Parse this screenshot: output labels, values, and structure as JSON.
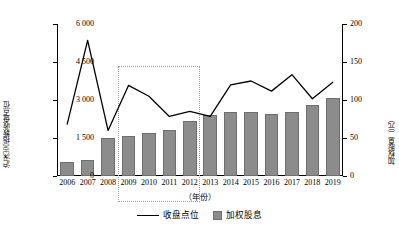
{
  "chart_data": {
    "type": "bar",
    "title": "",
    "xlabel": "（年份）",
    "categories": [
      "2006",
      "2007",
      "2008",
      "2009",
      "2010",
      "2011",
      "2012",
      "2013",
      "2014",
      "2015",
      "2016",
      "2017",
      "2018",
      "2019"
    ],
    "grid": false,
    "legend_position": "bottom",
    "axes": {
      "left": {
        "label": "沪深300指数收盘点位",
        "ticks": [
          "0",
          "1 500",
          "3 000",
          "4 500",
          "6 000"
        ],
        "tick_values": [
          0,
          1500,
          3000,
          4500,
          6000
        ],
        "range": [
          0,
          6000
        ]
      },
      "right": {
        "label": "加权股息（元）",
        "ticks": [
          "0",
          "50",
          "100",
          "150",
          "200"
        ],
        "tick_values": [
          0,
          50,
          100,
          150,
          200
        ],
        "range": [
          0,
          200
        ]
      }
    },
    "series": [
      {
        "name": "收盘点位",
        "render": "line",
        "axis": "left",
        "color": "#000000",
        "values": [
          2050,
          5350,
          1800,
          3575,
          3150,
          2350,
          2550,
          2350,
          3600,
          3750,
          3350,
          4000,
          3050,
          3700
        ]
      },
      {
        "name": "加权股息",
        "render": "bar",
        "axis": "right",
        "color": "#8c8c8c",
        "values": [
          19,
          21,
          50,
          52,
          56,
          60,
          73,
          80,
          84,
          84,
          82,
          84,
          93,
          102
        ]
      }
    ],
    "annotations": [
      {
        "type": "dotted-rectangle",
        "name": "highlight-region",
        "from_category": "2009",
        "to_category": "2012",
        "top_value_right_axis": 145,
        "color": "#9a9a9a"
      }
    ]
  },
  "legend": {
    "items": [
      {
        "label": "收盘点位",
        "marker": "line"
      },
      {
        "label": "加权股息",
        "marker": "square"
      }
    ]
  }
}
